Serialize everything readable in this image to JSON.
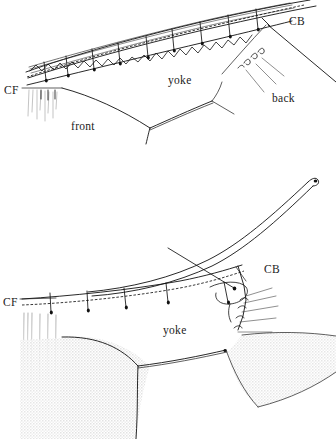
{
  "document": {
    "title": "Yoke Construction Diagram",
    "type": "technical-sewing-illustration",
    "background_color": "#ffffff",
    "ink_color": "#111111",
    "shade_color": "#e9e9e9",
    "width": 336,
    "height": 439
  },
  "figures": [
    {
      "id": "figure-top",
      "caption": "",
      "labels": [
        {
          "key": "cf",
          "text": "CF",
          "x": 4,
          "y": 90
        },
        {
          "key": "cb",
          "text": "CB",
          "x": 289,
          "y": 21
        },
        {
          "key": "yoke",
          "text": "yoke",
          "x": 168,
          "y": 80
        },
        {
          "key": "front",
          "text": "front",
          "x": 71,
          "y": 126
        },
        {
          "key": "back",
          "text": "back",
          "x": 272,
          "y": 98
        }
      ],
      "pin_count": 9,
      "gathering_stitch": true
    },
    {
      "id": "figure-bottom",
      "caption": "",
      "labels": [
        {
          "key": "cf",
          "text": "CF",
          "x": 3,
          "y": 302
        },
        {
          "key": "cb",
          "text": "CB",
          "x": 264,
          "y": 269
        },
        {
          "key": "yoke",
          "text": "yoke",
          "x": 163,
          "y": 330
        }
      ],
      "pin_count": 5,
      "gathering_stitch": true,
      "shaded_regions": 2
    }
  ],
  "legend_terms": {
    "cf": "center front",
    "cb": "center back",
    "yoke": "yoke panel",
    "front": "front panel",
    "back": "back panel"
  }
}
